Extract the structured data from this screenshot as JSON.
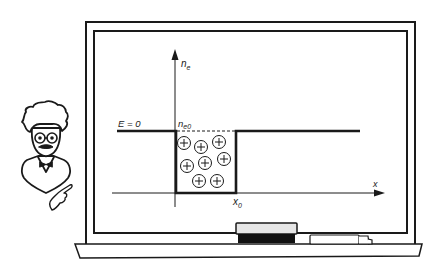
{
  "figure": {
    "type": "illustration",
    "colors": {
      "ink": "#1a1a1a",
      "board": "#ffffff",
      "eraser_top": "#e6e6e6",
      "eraser_felt": "#111111"
    }
  },
  "diagram": {
    "y_axis_label": "n",
    "y_axis_subscript": "e",
    "x_axis_label": "x",
    "field_label": "E = 0",
    "level_label": "n",
    "level_subscript": "e0",
    "well_edge_label": "x",
    "well_edge_subscript": "0",
    "ion_symbol": "+",
    "ion_count": 8
  },
  "chalkboard": {
    "items": [
      "eraser",
      "chalk"
    ]
  },
  "character": {
    "name": "professor",
    "gesture": "pointing"
  }
}
